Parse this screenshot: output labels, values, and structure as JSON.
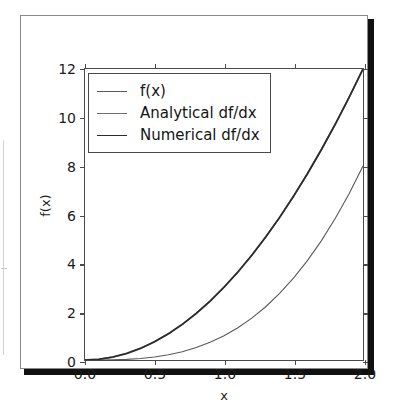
{
  "chart_data": {
    "type": "line",
    "title": "",
    "xlabel": "x",
    "ylabel": "f(x)",
    "xlim": [
      0.0,
      2.0
    ],
    "ylim": [
      0,
      12
    ],
    "grid": false,
    "legend_position": "upper left",
    "xticks": [
      "0.0",
      "0.5",
      "1.0",
      "1.5",
      "2.0"
    ],
    "xtick_values": [
      0.0,
      0.5,
      1.0,
      1.5,
      2.0
    ],
    "yticks": [
      "0",
      "2",
      "4",
      "6",
      "8",
      "10",
      "12"
    ],
    "ytick_values": [
      0,
      2,
      4,
      6,
      8,
      10,
      12
    ],
    "x": [
      0.0,
      0.1,
      0.2,
      0.3,
      0.4,
      0.5,
      0.6,
      0.7,
      0.8,
      0.9,
      1.0,
      1.1,
      1.2,
      1.3,
      1.4,
      1.5,
      1.6,
      1.7,
      1.8,
      1.9,
      2.0
    ],
    "series": [
      {
        "name": "f(x)",
        "color": "#5a5a5a",
        "linewidth": 1.1,
        "values": [
          0.0,
          0.001,
          0.008,
          0.027,
          0.064,
          0.125,
          0.216,
          0.343,
          0.512,
          0.729,
          1.0,
          1.331,
          1.728,
          2.197,
          2.744,
          3.375,
          4.096,
          4.913,
          5.832,
          6.859,
          8.0
        ]
      },
      {
        "name": "Analytical df/dx",
        "color": "#6e6e6e",
        "linewidth": 1.8,
        "values": [
          0.0,
          0.03,
          0.12,
          0.27,
          0.48,
          0.75,
          1.08,
          1.47,
          1.92,
          2.43,
          3.0,
          3.63,
          4.32,
          5.07,
          5.88,
          6.75,
          7.68,
          8.67,
          9.72,
          10.83,
          12.0
        ]
      },
      {
        "name": "Numerical df/dx",
        "color": "#2a2a2a",
        "linewidth": 1.6,
        "values": [
          0.0,
          0.03,
          0.12,
          0.27,
          0.48,
          0.75,
          1.08,
          1.47,
          1.92,
          2.43,
          3.0,
          3.63,
          4.32,
          5.07,
          5.88,
          6.75,
          7.68,
          8.67,
          9.72,
          10.83,
          12.0
        ]
      }
    ]
  },
  "legend": {
    "entries": [
      {
        "label": "f(x)"
      },
      {
        "label": "Analytical df/dx"
      },
      {
        "label": "Numerical df/dx"
      }
    ]
  },
  "axes": {
    "xlabel": "x",
    "ylabel": "f(x)"
  }
}
